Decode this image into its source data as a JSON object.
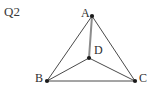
{
  "figure": {
    "question_label": "Q2",
    "background_color": "#ffffff",
    "width": 151,
    "height": 93,
    "stroke_color": "#4a4a4a",
    "stroke_color_light": "#8c8c8c",
    "vertex_color": "#1a1a1a",
    "label_color": "#2e2e2e"
  },
  "chart_data": {
    "type": "diagram",
    "title": "Q2",
    "points": [
      {
        "name": "A",
        "x": 92,
        "y": 16,
        "label": "A",
        "label_x": 81,
        "label_y": 7,
        "label_position": "upper-left"
      },
      {
        "name": "B",
        "x": 47,
        "y": 81,
        "label": "B",
        "label_x": 35,
        "label_y": 72,
        "label_position": "left"
      },
      {
        "name": "C",
        "x": 135,
        "y": 81,
        "label": "C",
        "label_x": 139,
        "label_y": 72,
        "label_position": "right"
      },
      {
        "name": "D",
        "x": 89,
        "y": 58,
        "label": "D",
        "label_x": 94,
        "label_y": 44,
        "label_position": "upper-right"
      }
    ],
    "segments": [
      {
        "name": "AB",
        "from": "A",
        "to": "B",
        "x1": 92,
        "y1": 16,
        "x2": 47,
        "y2": 81,
        "kind": "triangle-side",
        "color": "#4a4a4a",
        "width": 1
      },
      {
        "name": "BC",
        "from": "B",
        "to": "C",
        "x1": 47,
        "y1": 81,
        "x2": 135,
        "y2": 81,
        "kind": "triangle-side",
        "color": "#4a4a4a",
        "width": 1
      },
      {
        "name": "CA",
        "from": "C",
        "to": "A",
        "x1": 135,
        "y1": 81,
        "x2": 92,
        "y2": 16,
        "kind": "triangle-side",
        "color": "#4a4a4a",
        "width": 1
      },
      {
        "name": "AD",
        "from": "A",
        "to": "D",
        "x1": 92,
        "y1": 16,
        "x2": 89,
        "y2": 58,
        "kind": "cevian",
        "color": "#8c8c8c",
        "width": 2
      },
      {
        "name": "BD",
        "from": "B",
        "to": "D",
        "x1": 47,
        "y1": 81,
        "x2": 89,
        "y2": 58,
        "kind": "cevian",
        "color": "#4a4a4a",
        "width": 1
      },
      {
        "name": "CD",
        "from": "C",
        "to": "D",
        "x1": 135,
        "y1": 81,
        "x2": 89,
        "y2": 58,
        "kind": "cevian",
        "color": "#4a4a4a",
        "width": 1
      }
    ],
    "vertex_radius": 2.1
  }
}
